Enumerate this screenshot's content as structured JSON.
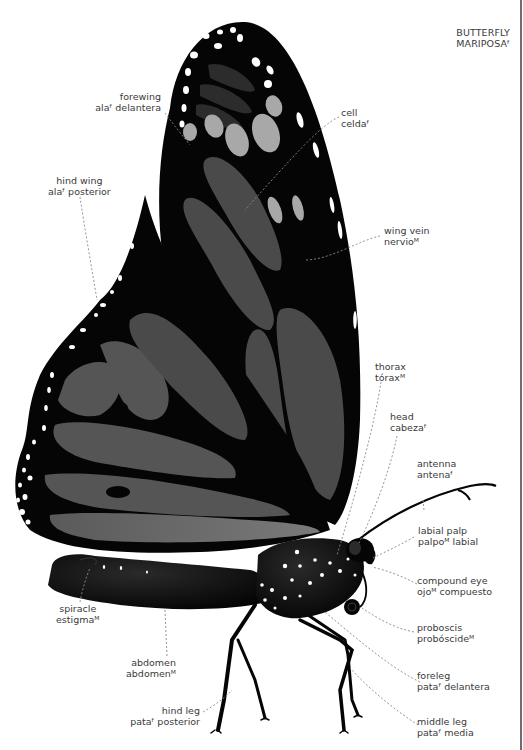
{
  "title": {
    "en": "BUTTERFLY",
    "es": "MARIPOSAᶠ"
  },
  "colors": {
    "background": "#ffffff",
    "wing_black": "#050505",
    "wing_cell_gray": "#4a4a4a",
    "wing_spot_light": "#a8a8a8",
    "spot_white": "#ffffff",
    "label_text": "#3a3a3a",
    "leader_line": "#8a8a8a",
    "page_edge": "#6d6d6d"
  },
  "labels": {
    "forewing": {
      "en": "forewing",
      "es": "alaᶠ delantera"
    },
    "hind_wing": {
      "en": "hind wing",
      "es": "alaᶠ posterior"
    },
    "cell": {
      "en": "cell",
      "es": "celdaᶠ"
    },
    "wing_vein": {
      "en": "wing vein",
      "es": "nervioᴹ"
    },
    "thorax": {
      "en": "thorax",
      "es": "tóraxᴹ"
    },
    "head": {
      "en": "head",
      "es": "cabezaᶠ"
    },
    "antenna": {
      "en": "antenna",
      "es": "antenaᶠ"
    },
    "labial_palp": {
      "en": "labial palp",
      "es": "palpoᴹ labial"
    },
    "compound_eye": {
      "en": "compound eye",
      "es": "ojoᴹ compuesto"
    },
    "proboscis": {
      "en": "proboscis",
      "es": "probóscideᴹ"
    },
    "foreleg": {
      "en": "foreleg",
      "es": "pataᶠ delantera"
    },
    "middle_leg": {
      "en": "middle leg",
      "es": "pataᶠ media"
    },
    "hind_leg": {
      "en": "hind leg",
      "es": "pataᶠ posterior"
    },
    "abdomen": {
      "en": "abdomen",
      "es": "abdomenᴹ"
    },
    "spiracle": {
      "en": "spiracle",
      "es": "estigmaᴹ"
    }
  }
}
